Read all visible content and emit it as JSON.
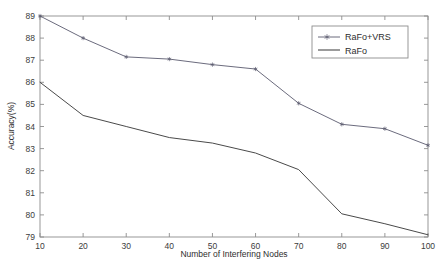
{
  "chart_data": {
    "type": "line",
    "title": "",
    "xlabel": "Number of Interfering Nodes",
    "ylabel": "Accuracy(%)",
    "x": [
      10,
      20,
      30,
      40,
      50,
      60,
      70,
      80,
      90,
      100
    ],
    "xlim": [
      10,
      100
    ],
    "ylim": [
      79,
      89
    ],
    "xticks": [
      "10",
      "20",
      "30",
      "40",
      "50",
      "60",
      "70",
      "80",
      "90",
      "100"
    ],
    "yticks": [
      "79",
      "80",
      "81",
      "82",
      "83",
      "84",
      "85",
      "86",
      "87",
      "88",
      "89"
    ],
    "grid": false,
    "legend_position": "top-right",
    "series": [
      {
        "name": "RaFo+VRS",
        "values": [
          89.0,
          88.0,
          87.15,
          87.05,
          86.8,
          86.6,
          85.05,
          84.1,
          83.9,
          83.15
        ],
        "color": "#5a5a6e",
        "marker": "asterisk"
      },
      {
        "name": "RaFo",
        "values": [
          86.0,
          84.5,
          84.0,
          83.5,
          83.25,
          82.8,
          82.05,
          80.05,
          79.6,
          79.1
        ],
        "color": "#4a4a4a",
        "marker": "none"
      }
    ]
  },
  "legend": {
    "entries": [
      {
        "label": "RaFo+VRS"
      },
      {
        "label": "RaFo"
      }
    ]
  },
  "axes": {
    "x_title": "Number of Interfering Nodes",
    "y_title": "Accuracy(%)"
  },
  "colors": {
    "axis": "#8d8d8d",
    "text": "#3c3c3c",
    "series_1": "#5a5a6e",
    "series_2": "#4a4a4a",
    "background": "#ffffff"
  }
}
